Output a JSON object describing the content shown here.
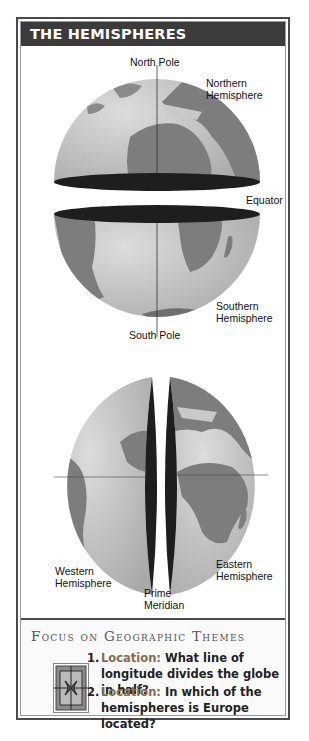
{
  "title": "THE HEMISPHERES",
  "diagram": {
    "top_globe": {
      "labels": {
        "north_pole": "North Pole",
        "northern_hemisphere": [
          "Northern",
          "Hemisphere"
        ],
        "equator": "Equator",
        "southern_hemisphere": [
          "Southern",
          "Hemisphere"
        ],
        "south_pole": "South Pole"
      }
    },
    "bottom_globe": {
      "labels": {
        "western_hemisphere": [
          "Western",
          "Hemisphere"
        ],
        "eastern_hemisphere": [
          "Eastern",
          "Hemisphere"
        ],
        "prime_meridian": [
          "Prime",
          "Meridian"
        ]
      }
    },
    "colors": {
      "ocean": "#c9c9c9",
      "land": "#7d7d7d",
      "cut_face": "#1e1e1e",
      "title_bar": "#3b3b3b"
    }
  },
  "focus": {
    "heading": "Focus on Geographic Themes",
    "icon": "compass-emblem-icon",
    "questions": [
      {
        "number": "1.",
        "theme": "Location:",
        "text": "What line of longitude divides the globe in half?"
      },
      {
        "number": "2.",
        "theme": "Location:",
        "text": "In which of the hemispheres is Europe located?"
      }
    ]
  }
}
